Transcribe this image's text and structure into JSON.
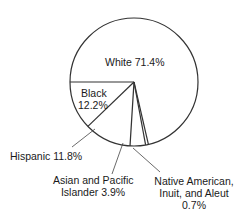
{
  "chart_data": {
    "type": "pie",
    "title": "",
    "categories": [
      "White",
      "Black",
      "Hispanic",
      "Asian and Pacific Islander",
      "Native American, Inuit, and Aleut"
    ],
    "values": [
      71.4,
      12.2,
      11.8,
      3.9,
      0.7
    ],
    "unit": "%",
    "legend": "none",
    "slice_colors": [
      "#ffffff",
      "#ffffff",
      "#ffffff",
      "#ffffff",
      "#ffffff"
    ],
    "outline_color": "#333333"
  },
  "labels": {
    "white": "White 71.4%",
    "black_name": "Black",
    "black_value": "12.2%",
    "hispanic": "Hispanic 11.8%",
    "asian_line1": "Asian and Pacific",
    "asian_line2": "Islander 3.9%",
    "native_line1": "Native American,",
    "native_line2": "Inuit, and Aleut",
    "native_line3": "0.7%"
  }
}
